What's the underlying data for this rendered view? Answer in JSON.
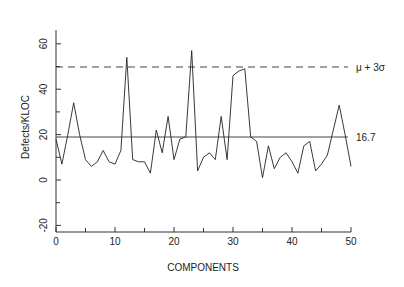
{
  "chart_data": {
    "type": "line",
    "title": "",
    "xlabel": "COMPONENTS",
    "ylabel": "Defects/KLOC",
    "xlim": [
      0,
      50
    ],
    "ylim": [
      -25,
      70
    ],
    "grid": false,
    "x_ticks": [
      0,
      10,
      20,
      30,
      40,
      50
    ],
    "x_minor_ticks": [
      5,
      15,
      25,
      35,
      45
    ],
    "y_ticks": [
      -20,
      0,
      20,
      40,
      60
    ],
    "y_minor_ticks": [
      -10,
      10,
      30,
      50,
      70
    ],
    "x": [
      0,
      1,
      2,
      3,
      4,
      5,
      6,
      7,
      8,
      9,
      10,
      11,
      12,
      13,
      14,
      15,
      16,
      17,
      18,
      19,
      20,
      21,
      22,
      23,
      24,
      25,
      26,
      27,
      28,
      29,
      30,
      31,
      32,
      33,
      34,
      35,
      36,
      37,
      38,
      39,
      40,
      41,
      42,
      43,
      44,
      45,
      46,
      47,
      48,
      49,
      50
    ],
    "series": [
      {
        "name": "Defects/KLOC",
        "values": [
          18,
          7,
          20,
          34,
          20,
          9,
          6,
          8,
          13,
          8,
          7,
          13,
          54,
          9,
          8,
          8,
          3,
          22,
          12,
          28,
          9,
          18,
          19,
          57,
          4,
          10,
          12,
          9,
          28,
          9,
          46,
          48,
          49,
          19,
          17,
          1,
          15,
          5,
          10,
          12,
          8,
          3,
          15,
          17,
          4,
          7,
          11,
          22,
          33,
          20,
          6
        ]
      }
    ],
    "reference_lines": [
      {
        "name": "mean",
        "value": 16.7,
        "label": "16.7",
        "style": "solid"
      },
      {
        "name": "ucl",
        "value": 49,
        "label": "μ + 3σ",
        "style": "dashed"
      }
    ]
  }
}
